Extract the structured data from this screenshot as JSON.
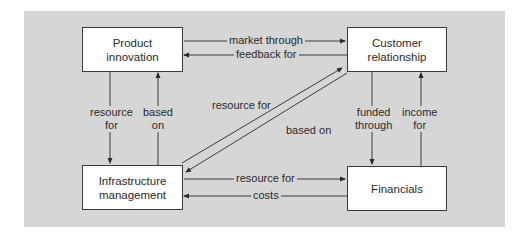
{
  "diagram": {
    "type": "flow",
    "nodes": [
      {
        "id": "product_innovation",
        "line1": "Product",
        "line2": "innovation"
      },
      {
        "id": "customer_relationship",
        "line1": "Customer",
        "line2": "relationship"
      },
      {
        "id": "infrastructure_management",
        "line1": "Infrastructure",
        "line2": "management"
      },
      {
        "id": "financials",
        "line1": "Financials",
        "line2": ""
      }
    ],
    "edges": [
      {
        "from": "product_innovation",
        "to": "customer_relationship",
        "label": "market through"
      },
      {
        "from": "customer_relationship",
        "to": "product_innovation",
        "label": "feedback for"
      },
      {
        "from": "product_innovation",
        "to": "infrastructure_management",
        "label_line1": "resource",
        "label_line2": "for"
      },
      {
        "from": "infrastructure_management",
        "to": "product_innovation",
        "label_line1": "based",
        "label_line2": "on"
      },
      {
        "from": "infrastructure_management",
        "to": "customer_relationship",
        "label": "resource for"
      },
      {
        "from": "customer_relationship",
        "to": "infrastructure_management",
        "label": "based on"
      },
      {
        "from": "customer_relationship",
        "to": "financials",
        "label_line1": "funded",
        "label_line2": "through"
      },
      {
        "from": "financials",
        "to": "customer_relationship",
        "label_line1": "income",
        "label_line2": "for"
      },
      {
        "from": "infrastructure_management",
        "to": "financials",
        "label": "resource for"
      },
      {
        "from": "financials",
        "to": "infrastructure_management",
        "label": "costs"
      }
    ]
  },
  "colors": {
    "panel_background": "#d6d6d6",
    "box_fill": "#ffffff",
    "line": "#3a3a3a"
  }
}
